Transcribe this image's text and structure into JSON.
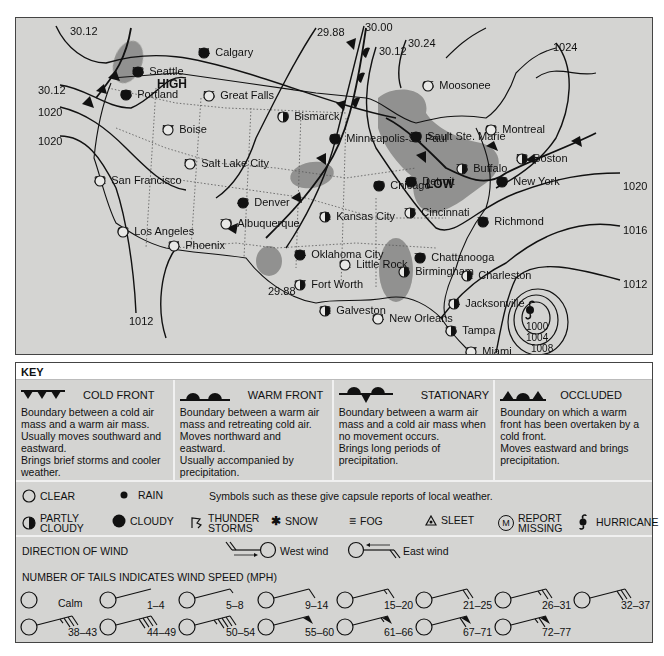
{
  "map": {
    "pressure_highs_lows": [
      {
        "label": "HIGH",
        "x": 145,
        "y": 60
      },
      {
        "label": "LOW",
        "x": 410,
        "y": 160
      }
    ],
    "isobars": [
      "30.12",
      "30.12",
      "1020",
      "1020",
      "29.88",
      "30.00",
      "30.12",
      "30.24",
      "1024",
      "1020",
      "1016",
      "1012",
      "1012",
      "29.88",
      "1000",
      "1004",
      "1008"
    ],
    "isobar_labels": [
      {
        "text": "30.12",
        "x": 54,
        "y": 8
      },
      {
        "text": "30.12",
        "x": 22,
        "y": 67
      },
      {
        "text": "1020",
        "x": 22,
        "y": 89
      },
      {
        "text": "1020",
        "x": 22,
        "y": 118
      },
      {
        "text": "29.88",
        "x": 301,
        "y": 9
      },
      {
        "text": "30.00",
        "x": 349,
        "y": 5
      },
      {
        "text": "30.12",
        "x": 363,
        "y": 29
      },
      {
        "text": "30.24",
        "x": 390,
        "y": 21
      },
      {
        "text": "1024",
        "x": 537,
        "y": 24
      },
      {
        "text": "1020",
        "x": 608,
        "y": 163
      },
      {
        "text": "1016",
        "x": 608,
        "y": 207
      },
      {
        "text": "1012",
        "x": 608,
        "y": 261
      },
      {
        "text": "1012",
        "x": 113,
        "y": 299
      },
      {
        "text": "29.88",
        "x": 252,
        "y": 268
      },
      {
        "text": "1000",
        "x": 510,
        "y": 303
      },
      {
        "text": "1004",
        "x": 510,
        "y": 315
      },
      {
        "text": "1008",
        "x": 515,
        "y": 327
      }
    ],
    "cities": [
      {
        "name": "Seattle",
        "temp": "58",
        "symbol": "cloudy",
        "x": 116,
        "y": 48
      },
      {
        "name": "Portland",
        "temp": "63",
        "symbol": "cloudy",
        "x": 104,
        "y": 71
      },
      {
        "name": "Calgary",
        "temp": "54",
        "symbol": "cloudy",
        "x": 182,
        "y": 29
      },
      {
        "name": "Great Falls",
        "temp": "55",
        "symbol": "clear",
        "x": 187,
        "y": 72
      },
      {
        "name": "Boise",
        "temp": "57",
        "symbol": "clear",
        "x": 146,
        "y": 106
      },
      {
        "name": "Salt Lake City",
        "temp": "58",
        "symbol": "clear",
        "x": 168,
        "y": 140
      },
      {
        "name": "San Francisco",
        "temp": "82",
        "symbol": "clear",
        "x": 78,
        "y": 157
      },
      {
        "name": "Los Angeles",
        "temp": "68",
        "symbol": "clear",
        "x": 101,
        "y": 208
      },
      {
        "name": "Phoenix",
        "temp": "84",
        "symbol": "clear",
        "x": 152,
        "y": 222
      },
      {
        "name": "Albuquerque",
        "temp": "70",
        "symbol": "clear",
        "x": 204,
        "y": 200
      },
      {
        "name": "Denver",
        "temp": "48",
        "symbol": "cloudy",
        "x": 221,
        "y": 179
      },
      {
        "name": "Bismarck",
        "temp": "60",
        "symbol": "partly-cloudy",
        "x": 261,
        "y": 93
      },
      {
        "name": "Minneapolis-St. Paul",
        "temp": "66",
        "symbol": "cloudy",
        "x": 313,
        "y": 115
      },
      {
        "name": "Kansas City",
        "temp": "81",
        "symbol": "partly-cloudy",
        "x": 303,
        "y": 193
      },
      {
        "name": "Oklahoma City",
        "temp": "84",
        "symbol": "cloudy",
        "x": 278,
        "y": 231
      },
      {
        "name": "Fort Worth",
        "temp": "87",
        "symbol": "partly-cloudy",
        "x": 278,
        "y": 261
      },
      {
        "name": "Galveston",
        "temp": "82",
        "symbol": "partly-cloudy",
        "x": 303,
        "y": 287
      },
      {
        "name": "Little Rock",
        "temp": "91",
        "symbol": "clear",
        "x": 323,
        "y": 241
      },
      {
        "name": "Chicago",
        "temp": "60",
        "symbol": "cloudy",
        "x": 357,
        "y": 162
      },
      {
        "name": "Cincinnati",
        "temp": "73",
        "symbol": "partly-cloudy",
        "x": 388,
        "y": 189
      },
      {
        "name": "Detroit",
        "temp": "63",
        "symbol": "cloudy",
        "x": 389,
        "y": 158
      },
      {
        "name": "Sault Ste. Marie",
        "temp": "59",
        "symbol": "cloudy",
        "x": 394,
        "y": 113
      },
      {
        "name": "Moosonee",
        "temp": "65",
        "symbol": "clear",
        "x": 406,
        "y": 62
      },
      {
        "name": "Chattanooga",
        "temp": "79",
        "symbol": "cloudy",
        "x": 398,
        "y": 234
      },
      {
        "name": "Birmingham",
        "temp": "76",
        "symbol": "partly-cloudy",
        "x": 382,
        "y": 248
      },
      {
        "name": "New Orleans",
        "temp": "84",
        "symbol": "clear",
        "x": 356,
        "y": 295
      },
      {
        "name": "Montreal",
        "temp": "62",
        "symbol": "clear",
        "x": 469,
        "y": 106
      },
      {
        "name": "Buffalo",
        "temp": "73",
        "symbol": "partly-cloudy",
        "x": 440,
        "y": 145
      },
      {
        "name": "Boston",
        "temp": "58",
        "symbol": "partly-cloudy",
        "x": 500,
        "y": 135
      },
      {
        "name": "New York",
        "temp": "60",
        "symbol": "cloudy",
        "x": 480,
        "y": 158
      },
      {
        "name": "Richmond",
        "temp": "76",
        "symbol": "cloudy",
        "x": 461,
        "y": 198
      },
      {
        "name": "Charleston",
        "temp": "82",
        "symbol": "partly-cloudy",
        "x": 445,
        "y": 252
      },
      {
        "name": "Jacksonville",
        "temp": "84",
        "symbol": "partly-cloudy",
        "x": 432,
        "y": 280
      },
      {
        "name": "Tampa",
        "temp": "86",
        "symbol": "partly-cloudy",
        "x": 429,
        "y": 307
      },
      {
        "name": "Miami",
        "temp": "87",
        "symbol": "clear",
        "x": 449,
        "y": 328
      }
    ],
    "hurricane": {
      "x": 529,
      "y": 309
    }
  },
  "key": {
    "title": "KEY",
    "fronts": [
      {
        "name": "COLD FRONT",
        "icon": "cold-front",
        "description": "Boundary between a cold air mass and a warm air mass.\nUsually moves southward and eastward.\nBrings brief storms and cooler weather."
      },
      {
        "name": "WARM FRONT",
        "icon": "warm-front",
        "description": "Boundary between a warm air mass and retreating cold air.\nMoves northward and eastward.\nUsually accompanied by precipitation."
      },
      {
        "name": "STATIONARY",
        "icon": "stationary-front",
        "description": "Boundary between a warm air mass and a cold air mass when no movement occurs.\nBrings long periods of precipitation."
      },
      {
        "name": "OCCLUDED",
        "icon": "occluded-front",
        "description": "Boundary on which a warm front has been overtaken by a cold front.\nMoves eastward and brings precipitation."
      }
    ],
    "symbols_note": "Symbols such as these give capsule reports of local weather.",
    "symbols": {
      "clear": "CLEAR",
      "rain": "RAIN",
      "partly_cloudy_1": "PARTLY",
      "partly_cloudy_2": "CLOUDY",
      "cloudy": "CLOUDY",
      "thunder_1": "THUNDER",
      "thunder_2": "STORMS",
      "snow": "SNOW",
      "fog": "FOG",
      "sleet": "SLEET",
      "missing_1": "REPORT",
      "missing_2": "MISSING",
      "missing_glyph": "M",
      "hurricane": "HURRICANE"
    },
    "wind_direction": {
      "label": "DIRECTION OF WIND",
      "west": "West wind",
      "east": "East wind"
    },
    "wind_speed": {
      "label": "NUMBER OF TAILS INDICATES WIND SPEED (MPH)",
      "row1": [
        {
          "label": "Calm",
          "full": 0,
          "half": 0,
          "flag": 0
        },
        {
          "label": "1–4",
          "full": 0,
          "half": 0,
          "flag": 0
        },
        {
          "label": "5–8",
          "full": 0,
          "half": 1,
          "flag": 0
        },
        {
          "label": "9–14",
          "full": 1,
          "half": 0,
          "flag": 0
        },
        {
          "label": "15–20",
          "full": 1,
          "half": 1,
          "flag": 0
        },
        {
          "label": "21–25",
          "full": 2,
          "half": 0,
          "flag": 0
        },
        {
          "label": "26–31",
          "full": 2,
          "half": 1,
          "flag": 0
        },
        {
          "label": "32–37",
          "full": 3,
          "half": 0,
          "flag": 0
        }
      ],
      "row2": [
        {
          "label": "38–43",
          "full": 3,
          "half": 1,
          "flag": 0
        },
        {
          "label": "44–49",
          "full": 4,
          "half": 0,
          "flag": 0
        },
        {
          "label": "50–54",
          "full": 4,
          "half": 1,
          "flag": 0
        },
        {
          "label": "55–60",
          "full": 0,
          "half": 0,
          "flag": 1
        },
        {
          "label": "61–66",
          "full": 0,
          "half": 1,
          "flag": 1
        },
        {
          "label": "67–71",
          "full": 1,
          "half": 0,
          "flag": 1
        },
        {
          "label": "72–77",
          "full": 1,
          "half": 1,
          "flag": 1
        }
      ]
    }
  }
}
